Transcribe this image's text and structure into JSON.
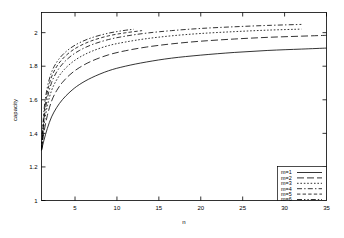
{
  "chart_data": {
    "type": "line",
    "title": "",
    "xlabel": "n",
    "ylabel": "capacity",
    "xlim": [
      1,
      35
    ],
    "ylim": [
      1,
      2.12
    ],
    "grid": false,
    "legend_position": "bottom-right",
    "x_ticks": [
      "5",
      "10",
      "15",
      "20",
      "25",
      "30",
      "35"
    ],
    "x_tick_values": [
      5,
      10,
      15,
      20,
      25,
      30,
      35
    ],
    "y_ticks": [
      "1",
      "1.2",
      "1.4",
      "1.6",
      "1.8",
      "2"
    ],
    "y_tick_values": [
      1,
      1.2,
      1.4,
      1.6,
      1.8,
      2
    ],
    "series": [
      {
        "name": "m=1",
        "dash": "none",
        "x": [
          1,
          1.3,
          1.7,
          2.2,
          2.8,
          3.5,
          4.4,
          5.5,
          7,
          9,
          11,
          13.5,
          16.5,
          20,
          24,
          28,
          32,
          35
        ],
        "y": [
          1.3,
          1.36,
          1.43,
          1.498,
          1.553,
          1.601,
          1.647,
          1.69,
          1.732,
          1.773,
          1.8,
          1.825,
          1.848,
          1.866,
          1.882,
          1.894,
          1.902,
          1.908
        ]
      },
      {
        "name": "m=2",
        "dash": "long",
        "x": [
          1,
          1.3,
          1.7,
          2.2,
          2.8,
          3.5,
          4.4,
          5.5,
          7,
          9,
          11,
          13.5,
          16.5,
          20,
          24,
          28,
          32,
          35
        ],
        "y": [
          1.3,
          1.408,
          1.507,
          1.592,
          1.654,
          1.704,
          1.75,
          1.791,
          1.831,
          1.868,
          1.892,
          1.914,
          1.933,
          1.949,
          1.962,
          1.972,
          1.979,
          1.984
        ]
      },
      {
        "name": "m=3",
        "dash": "dotted",
        "x": [
          1,
          1.3,
          1.7,
          2.2,
          2.8,
          3.5,
          4.4,
          5.5,
          7,
          9,
          11,
          13.5,
          16.5,
          20,
          24,
          28,
          32
        ],
        "y": [
          1.3,
          1.448,
          1.565,
          1.655,
          1.718,
          1.768,
          1.813,
          1.852,
          1.889,
          1.923,
          1.944,
          1.964,
          1.981,
          1.995,
          2.006,
          2.015,
          2.021
        ]
      },
      {
        "name": "m=4",
        "dash": "dashdot",
        "x": [
          1,
          1.3,
          1.7,
          2.2,
          2.8,
          3.5,
          4.4,
          5.5,
          7,
          9,
          11,
          13.5,
          16.5,
          20,
          24,
          28,
          32
        ],
        "y": [
          1.3,
          1.482,
          1.61,
          1.702,
          1.765,
          1.813,
          1.856,
          1.893,
          1.928,
          1.959,
          1.979,
          1.997,
          2.012,
          2.025,
          2.035,
          2.043,
          2.049
        ]
      },
      {
        "name": "m=5",
        "dash": "shortdash",
        "x": [
          1,
          1.3,
          1.7,
          2.2,
          2.8,
          3.5,
          4.4,
          5.5,
          7,
          9,
          11,
          13
        ],
        "y": [
          1.3,
          1.512,
          1.645,
          1.736,
          1.797,
          1.843,
          1.884,
          1.919,
          1.952,
          1.981,
          1.999,
          2.012
        ]
      },
      {
        "name": "m=6",
        "dash": "dashdotdot",
        "x": [
          1,
          1.3,
          1.7,
          2.2,
          2.8,
          3.5,
          4.4,
          5.5,
          7,
          9,
          11,
          12
        ],
        "y": [
          1.3,
          1.538,
          1.675,
          1.764,
          1.823,
          1.867,
          1.906,
          1.939,
          1.97,
          1.997,
          2.014,
          2.02
        ]
      }
    ]
  },
  "axis": {
    "xlabel": "n",
    "ylabel": "capacity"
  }
}
